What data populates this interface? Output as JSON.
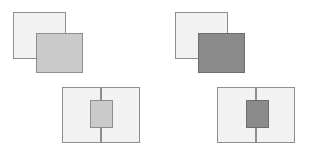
{
  "figure": {
    "background_color": "#ffffff",
    "layout": "2x2 grid of geometric stimulus panels",
    "panels": [
      {
        "id": "top-left",
        "name": "offset-overlap-light",
        "shapes": [
          {
            "role": "background-square",
            "fill": "#f2f2f2",
            "stroke": "#8e8e8e",
            "x": 13,
            "y": 12,
            "w": 53,
            "h": 47
          },
          {
            "role": "foreground-square",
            "fill": "#cacaca",
            "stroke": "#8e8e8e",
            "x": 36,
            "y": 33,
            "w": 47,
            "h": 40
          }
        ]
      },
      {
        "id": "top-right",
        "name": "offset-overlap-dark",
        "shapes": [
          {
            "role": "background-square",
            "fill": "#f2f2f2",
            "stroke": "#8e8e8e",
            "x": 19,
            "y": 12,
            "w": 53,
            "h": 47
          },
          {
            "role": "foreground-square",
            "fill": "#8a8a8a",
            "stroke": "#6e6e6e",
            "x": 42,
            "y": 33,
            "w": 47,
            "h": 40
          }
        ]
      },
      {
        "id": "bottom-left",
        "name": "centered-inset-light",
        "shapes": [
          {
            "role": "frame-rectangle",
            "fill": "#f2f2f2",
            "stroke": "#8e8e8e",
            "x": 62,
            "y": 11,
            "w": 78,
            "h": 56
          },
          {
            "role": "vertical-divider",
            "fill": "#8e8e8e",
            "x": 100,
            "y": 11,
            "w": 2,
            "h": 56
          },
          {
            "role": "center-square",
            "fill": "#cacaca",
            "stroke": "#8e8e8e",
            "x": 90,
            "y": 24,
            "w": 23,
            "h": 28
          }
        ]
      },
      {
        "id": "bottom-right",
        "name": "centered-inset-dark",
        "shapes": [
          {
            "role": "frame-rectangle",
            "fill": "#f2f2f2",
            "stroke": "#8e8e8e",
            "x": 61,
            "y": 11,
            "w": 78,
            "h": 56
          },
          {
            "role": "vertical-divider",
            "fill": "#8e8e8e",
            "x": 99,
            "y": 11,
            "w": 2,
            "h": 56
          },
          {
            "role": "center-square",
            "fill": "#8a8a8a",
            "stroke": "#6e6e6e",
            "x": 90,
            "y": 24,
            "w": 23,
            "h": 28
          }
        ]
      }
    ],
    "colors": {
      "light_fill": "#f2f2f2",
      "medium_gray_fill": "#cacaca",
      "dark_gray_fill": "#8a8a8a",
      "outline": "#8e8e8e",
      "dark_outline": "#6e6e6e"
    }
  }
}
